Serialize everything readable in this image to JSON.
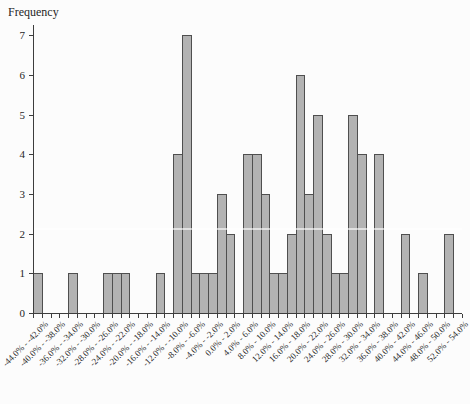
{
  "chart_data": {
    "type": "bar",
    "subtype": "histogram",
    "title": "Frequency",
    "ylabel": "Frequency",
    "xlabel": "",
    "grid": false,
    "legend": "none",
    "ylim": [
      0,
      7.25
    ],
    "y_ticks": [
      0,
      1,
      2,
      3,
      4,
      5,
      6,
      7
    ],
    "bin_width_pct": 2.0,
    "x_start_pct": -44.0,
    "x_end_pct": 54.0,
    "values": [
      1,
      0,
      0,
      0,
      1,
      0,
      0,
      0,
      1,
      1,
      1,
      0,
      0,
      0,
      1,
      0,
      4,
      7,
      1,
      1,
      1,
      3,
      2,
      0,
      4,
      4,
      3,
      1,
      1,
      2,
      6,
      3,
      5,
      2,
      1,
      1,
      5,
      4,
      0,
      4,
      0,
      0,
      2,
      0,
      1,
      0,
      0,
      2,
      0
    ],
    "x_tick_labels": [
      "-44.0% - -42.0%",
      "-40.0% - -38.0%",
      "-36.0% - -34.0%",
      "-32.0% - -30.0%",
      "-28.0% - -26.0%",
      "-24.0% - -22.0%",
      "-20.0% - -18.0%",
      "-16.0% - -14.0%",
      "-12.0% - -10.0%",
      "-8.0% - -6.0%",
      "-4.0% - -2.0%",
      "0.0% - 2.0%",
      "4.0% - 6.0%",
      "8.0% - 10.0%",
      "12.0% - 14.0%",
      "16.0% - 18.0%",
      "20.0% - 22.0%",
      "24.0% - 26.0%",
      "28.0% - 30.0%",
      "32.0% - 34.0%",
      "36.0% - 38.0%",
      "40.0% - 42.0%",
      "44.0% - 46.0%",
      "48.0% - 50.0%",
      "52.0% - 54.0%"
    ],
    "colors": {
      "bar_fill": "#b3b3b3",
      "bar_border": "#4f4f4f",
      "axis": "#3d3d3d",
      "text": "#1f1f1f",
      "background": "#fcfcfc"
    }
  }
}
